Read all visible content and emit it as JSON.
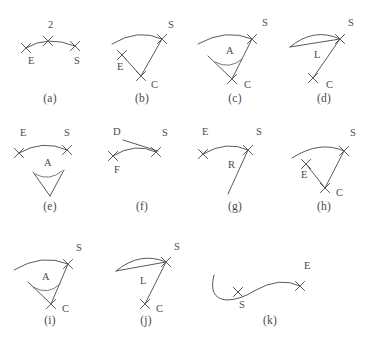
{
  "figure": {
    "panel_count": 11,
    "ink_color": "#5a5a5a",
    "text_color": "#4b4b4b",
    "background_color": "#ffffff",
    "marker_glyph": "x-cross-mark"
  },
  "panels": [
    {
      "id": "a",
      "caption": "(a)",
      "labels": [
        {
          "key": "two",
          "text": "2",
          "x": 44,
          "y": 22
        },
        {
          "key": "e",
          "text": "E",
          "x": 24,
          "y": 58
        },
        {
          "key": "s",
          "text": "S",
          "x": 70,
          "y": 58
        }
      ],
      "markers": [
        {
          "key": "marker-e",
          "x": 22,
          "y": 42
        },
        {
          "key": "marker-mid",
          "x": 44,
          "y": 35
        },
        {
          "key": "marker-s",
          "x": 71,
          "y": 40
        }
      ],
      "paths": [
        {
          "key": "arc",
          "d": "M 22 42 Q 43 29 71 40"
        }
      ]
    },
    {
      "id": "b",
      "caption": "(b)",
      "labels": [
        {
          "key": "s",
          "text": "S",
          "x": 72,
          "y": 22
        },
        {
          "key": "e",
          "text": "E",
          "x": 21,
          "y": 64
        },
        {
          "key": "c",
          "text": "C",
          "x": 55,
          "y": 82
        }
      ],
      "markers": [
        {
          "key": "marker-s",
          "x": 66,
          "y": 33
        },
        {
          "key": "marker-e",
          "x": 26,
          "y": 49
        },
        {
          "key": "marker-c",
          "x": 45,
          "y": 70
        }
      ],
      "paths": [
        {
          "key": "arc",
          "d": "M 16 38 Q 42 22 66 33"
        },
        {
          "key": "radius-e",
          "d": "M 26 49 L 45 70"
        },
        {
          "key": "radius-s",
          "d": "M 45 70 L 66 33"
        }
      ]
    },
    {
      "id": "c",
      "caption": "(c)",
      "labels": [
        {
          "key": "s",
          "text": "S",
          "x": 72,
          "y": 20
        },
        {
          "key": "a",
          "text": "A",
          "x": 36,
          "y": 48
        },
        {
          "key": "c",
          "text": "C",
          "x": 54,
          "y": 82
        }
      ],
      "markers": [
        {
          "key": "marker-s",
          "x": 62,
          "y": 33
        },
        {
          "key": "marker-c",
          "x": 42,
          "y": 73
        }
      ],
      "paths": [
        {
          "key": "arc",
          "d": "M 8 38 Q 36 22 62 33"
        },
        {
          "key": "ray-left",
          "d": "M 18 50 L 42 73"
        },
        {
          "key": "ray-right",
          "d": "M 42 73 L 62 33"
        },
        {
          "key": "angle-arc",
          "d": "M 25 56 Q 40 64 52 53"
        }
      ]
    },
    {
      "id": "d",
      "caption": "(d)",
      "labels": [
        {
          "key": "s",
          "text": "S",
          "x": 68,
          "y": 20
        },
        {
          "key": "l",
          "text": "L",
          "x": 34,
          "y": 52
        },
        {
          "key": "c",
          "text": "C",
          "x": 46,
          "y": 82
        }
      ],
      "markers": [
        {
          "key": "marker-s",
          "x": 60,
          "y": 33
        },
        {
          "key": "marker-c",
          "x": 33,
          "y": 72
        }
      ],
      "paths": [
        {
          "key": "arc",
          "d": "M 10 41 Q 34 21 60 33"
        },
        {
          "key": "chord",
          "d": "M 10 41 L 60 33"
        },
        {
          "key": "radius-c",
          "d": "M 33 72 L 60 33"
        }
      ]
    },
    {
      "id": "e",
      "caption": "(e)",
      "labels": [
        {
          "key": "e",
          "text": "E",
          "x": 16,
          "y": 18
        },
        {
          "key": "s",
          "text": "S",
          "x": 60,
          "y": 18
        },
        {
          "key": "a",
          "text": "A",
          "x": 40,
          "y": 48
        }
      ],
      "markers": [
        {
          "key": "marker-e",
          "x": 15,
          "y": 35
        },
        {
          "key": "marker-s",
          "x": 63,
          "y": 32
        }
      ],
      "paths": [
        {
          "key": "arc",
          "d": "M 15 35 Q 39 21 63 32"
        },
        {
          "key": "wedge-left",
          "d": "M 29 54 L 46 78"
        },
        {
          "key": "wedge-right",
          "d": "M 46 78 L 60 52"
        },
        {
          "key": "angle-arc",
          "d": "M 31 56 Q 45 64 58 53"
        }
      ]
    },
    {
      "id": "f",
      "caption": "(f)",
      "labels": [
        {
          "key": "d",
          "text": "D",
          "x": 17,
          "y": 17
        },
        {
          "key": "s",
          "text": "S",
          "x": 66,
          "y": 18
        },
        {
          "key": "f",
          "text": "F",
          "x": 18,
          "y": 55
        }
      ],
      "markers": [
        {
          "key": "marker-f",
          "x": 17,
          "y": 38
        },
        {
          "key": "marker-s",
          "x": 60,
          "y": 34
        }
      ],
      "paths": [
        {
          "key": "arc",
          "d": "M 17 38 Q 39 24 60 34"
        },
        {
          "key": "d-leader",
          "d": "M 27 22 L 62 33"
        }
      ]
    },
    {
      "id": "g",
      "caption": "(g)",
      "labels": [
        {
          "key": "e",
          "text": "E",
          "x": 12,
          "y": 17
        },
        {
          "key": "s",
          "text": "S",
          "x": 66,
          "y": 17
        },
        {
          "key": "r",
          "text": "R",
          "x": 38,
          "y": 50
        }
      ],
      "markers": [
        {
          "key": "marker-e",
          "x": 13,
          "y": 36
        },
        {
          "key": "marker-s",
          "x": 58,
          "y": 32
        }
      ],
      "paths": [
        {
          "key": "arc",
          "d": "M 13 36 Q 37 22 58 32"
        },
        {
          "key": "radius",
          "d": "M 58 32 L 38 76"
        }
      ]
    },
    {
      "id": "h",
      "caption": "(h)",
      "labels": [
        {
          "key": "s",
          "text": "S",
          "x": 70,
          "y": 18
        },
        {
          "key": "e",
          "text": "E",
          "x": 21,
          "y": 60
        },
        {
          "key": "c",
          "text": "C",
          "x": 56,
          "y": 78
        }
      ],
      "markers": [
        {
          "key": "marker-s",
          "x": 64,
          "y": 33
        },
        {
          "key": "marker-e",
          "x": 26,
          "y": 46
        },
        {
          "key": "marker-c",
          "x": 45,
          "y": 70
        }
      ],
      "paths": [
        {
          "key": "arc",
          "d": "M 12 40 Q 40 22 64 33"
        },
        {
          "key": "radius-e",
          "d": "M 26 46 L 45 70"
        },
        {
          "key": "radius-s",
          "d": "M 45 70 L 64 33"
        }
      ]
    },
    {
      "id": "i",
      "caption": "(i)",
      "labels": [
        {
          "key": "s",
          "text": "S",
          "x": 72,
          "y": 17
        },
        {
          "key": "a",
          "text": "A",
          "x": 38,
          "y": 46
        },
        {
          "key": "c",
          "text": "C",
          "x": 58,
          "y": 78
        }
      ],
      "markers": [
        {
          "key": "marker-s",
          "x": 64,
          "y": 30
        },
        {
          "key": "marker-c",
          "x": 47,
          "y": 70
        }
      ],
      "paths": [
        {
          "key": "arc",
          "d": "M 10 36 Q 38 19 64 30"
        },
        {
          "key": "ray-left",
          "d": "M 24 48 L 47 70"
        },
        {
          "key": "ray-right",
          "d": "M 47 70 L 64 30"
        },
        {
          "key": "angle-arc",
          "d": "M 29 53 Q 44 62 56 50"
        }
      ]
    },
    {
      "id": "j",
      "caption": "(j)",
      "labels": [
        {
          "key": "s",
          "text": "S",
          "x": 74,
          "y": 16
        },
        {
          "key": "l",
          "text": "L",
          "x": 40,
          "y": 50
        },
        {
          "key": "c",
          "text": "C",
          "x": 56,
          "y": 78
        }
      ],
      "markers": [
        {
          "key": "marker-s",
          "x": 66,
          "y": 28
        },
        {
          "key": "marker-c",
          "x": 45,
          "y": 70
        }
      ],
      "paths": [
        {
          "key": "arc",
          "d": "M 16 37 Q 40 17 66 28"
        },
        {
          "key": "chord",
          "d": "M 16 37 L 66 28"
        },
        {
          "key": "radius-c",
          "d": "M 45 70 L 66 28"
        }
      ]
    },
    {
      "id": "k",
      "caption": "(k)",
      "labels": [
        {
          "key": "s",
          "text": "S",
          "x": 39,
          "y": 74
        },
        {
          "key": "e",
          "text": "E",
          "x": 104,
          "y": 35
        }
      ],
      "markers": [
        {
          "key": "marker-s",
          "x": 38,
          "y": 58
        },
        {
          "key": "marker-e",
          "x": 100,
          "y": 52
        }
      ],
      "paths": [
        {
          "key": "hook-stroke",
          "d": "M 14 41 Q 8 64 26 66 Q 40 66 54 57 Q 80 42 100 52"
        }
      ]
    }
  ]
}
